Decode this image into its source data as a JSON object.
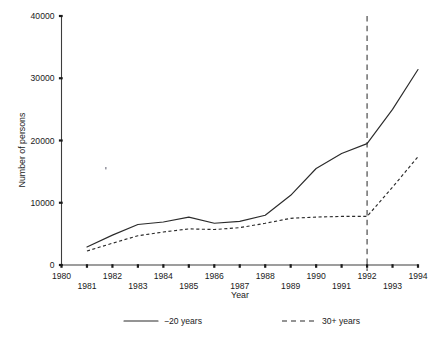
{
  "chart_data": {
    "type": "line",
    "title": "",
    "xlabel": "Year",
    "ylabel": "Number of persons",
    "xlim": [
      1980,
      1994
    ],
    "ylim": [
      0,
      40000
    ],
    "grid": false,
    "legend_position": "bottom",
    "x": [
      1980,
      1981,
      1982,
      1983,
      1984,
      1985,
      1986,
      1987,
      1988,
      1989,
      1990,
      1991,
      1992,
      1993,
      1994
    ],
    "xtick_labels_upper": [
      "1980",
      "",
      "1982",
      "",
      "1984",
      "",
      "1986",
      "",
      "1988",
      "",
      "1990",
      "",
      "1992",
      "",
      "1994"
    ],
    "xtick_labels_lower": [
      "",
      "1981",
      "",
      "1983",
      "",
      "1985",
      "",
      "1987",
      "",
      "1989",
      "",
      "1991",
      "",
      "1993",
      ""
    ],
    "ytick_labels": [
      "0",
      "10000",
      "20000",
      "30000",
      "40000"
    ],
    "ytick_values": [
      0,
      10000,
      20000,
      30000,
      40000
    ],
    "series": [
      {
        "name": "-20 years",
        "style": "solid",
        "x": [
          1981,
          1982,
          1983,
          1984,
          1985,
          1986,
          1987,
          1988,
          1989,
          1990,
          1991,
          1992,
          1993,
          1994
        ],
        "values": [
          2900,
          4800,
          6500,
          6900,
          7700,
          6700,
          7000,
          8000,
          11200,
          15500,
          17900,
          19500,
          25000,
          31400
        ]
      },
      {
        "name": "30+ years",
        "style": "dashed",
        "x": [
          1981,
          1982,
          1983,
          1984,
          1985,
          1986,
          1987,
          1988,
          1989,
          1990,
          1991,
          1992,
          1993,
          1994
        ],
        "values": [
          2250,
          3500,
          4700,
          5300,
          5800,
          5700,
          6000,
          6700,
          7500,
          7700,
          7800,
          7800,
          12500,
          17400
        ]
      }
    ],
    "annotations": [
      {
        "type": "vertical-reference-line",
        "x": 1992,
        "style": "dashed",
        "label": ""
      }
    ]
  },
  "legend": {
    "entries": [
      {
        "label": "−20 years",
        "style": "solid"
      },
      {
        "label": "30+ years",
        "style": "dashed"
      }
    ]
  }
}
